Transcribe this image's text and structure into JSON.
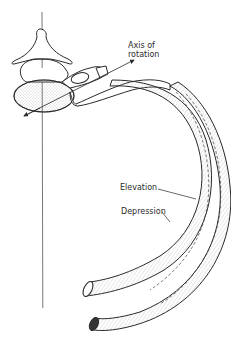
{
  "diagram": {
    "labels": {
      "axis_line1": "Axis of",
      "axis_line2": "rotation",
      "elevation": "Elevation",
      "depression": "Depression"
    },
    "parts": [
      "vertebra",
      "vertebral-body",
      "spinous-process",
      "transverse-process",
      "rib-elevated",
      "rib-depressed",
      "vertical-reference-line",
      "axis-of-rotation-arrow"
    ],
    "colors": {
      "ink": "#2a2a2a",
      "stipple": "#9a9a9a",
      "background": "#ffffff"
    }
  }
}
